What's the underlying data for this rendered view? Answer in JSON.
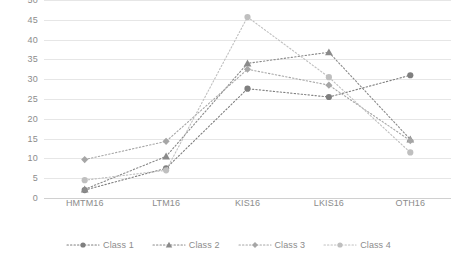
{
  "chart_data": {
    "type": "line",
    "title": "",
    "subtitle": "",
    "xlabel": "",
    "ylabel": "",
    "categories": [
      "HMTM16",
      "LTM16",
      "KIS16",
      "LKIS16",
      "OTH16"
    ],
    "ylim": [
      0,
      50
    ],
    "ytick_step": 5,
    "yticks": [
      0,
      5,
      10,
      15,
      20,
      25,
      30,
      35,
      40,
      45,
      50
    ],
    "ytick_labels": [
      "0",
      "5",
      "10",
      "15",
      "20",
      "25",
      "30",
      "35",
      "40",
      "45",
      "50"
    ],
    "grid": true,
    "grid_axis": "y",
    "legend_position": "bottom",
    "line_style": "dotted",
    "series": [
      {
        "name": "Class 1",
        "marker": "circle",
        "color": "#7f7f7f",
        "values": [
          2.0,
          7.5,
          27.6,
          25.5,
          31.0
        ]
      },
      {
        "name": "Class 2",
        "marker": "triangle",
        "color": "#8a8a8a",
        "values": [
          2.2,
          10.5,
          34.0,
          36.8,
          14.8
        ]
      },
      {
        "name": "Class 3",
        "marker": "diamond",
        "color": "#a6a6a6",
        "values": [
          9.7,
          14.3,
          32.5,
          28.5,
          14.5
        ]
      },
      {
        "name": "Class 4",
        "marker": "circle",
        "color": "#bfbfbf",
        "values": [
          4.5,
          7.0,
          45.7,
          30.5,
          11.5
        ]
      }
    ]
  },
  "legend": {
    "items": [
      {
        "label": "Class 1"
      },
      {
        "label": "Class 2"
      },
      {
        "label": "Class 3"
      },
      {
        "label": "Class 4"
      }
    ]
  },
  "colors": {
    "gridline": "#e6e6e6",
    "axis_text": "#8c8c8c",
    "background": "#ffffff"
  }
}
